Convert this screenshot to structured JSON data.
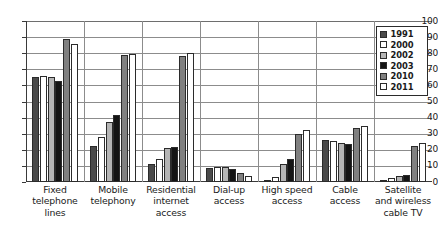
{
  "chart_data": {
    "type": "bar",
    "title": "",
    "xlabel": "",
    "ylabel": "",
    "ylim": [
      0,
      100
    ],
    "yticks": [
      0,
      10,
      20,
      30,
      40,
      50,
      60,
      70,
      80,
      90,
      100
    ],
    "ytick_labels": [
      "0",
      "10",
      "20",
      "30",
      "40",
      "50",
      "60",
      "70",
      "80",
      "90",
      "100"
    ],
    "grid": true,
    "legend_position": "top-right",
    "categories": [
      "Fixed telephone lines",
      "Mobile telephony",
      "Residential internet access",
      "Dial-up access",
      "High speed access",
      "Cable access",
      "Satellite and wireless cable TV"
    ],
    "category_lines": [
      [
        "Fixed",
        "telephone",
        "lines"
      ],
      [
        "Mobile",
        "telephony"
      ],
      [
        "Residential",
        "internet",
        "access"
      ],
      [
        "Dial-up",
        "access"
      ],
      [
        "High speed",
        "access"
      ],
      [
        "Cable",
        "access"
      ],
      [
        "Satellite",
        "and wireless",
        "cable TV"
      ]
    ],
    "series": [
      {
        "name": "1991",
        "color": "#4a4a4a",
        "values": [
          65,
          22.5,
          11,
          9,
          1.5,
          26,
          1
        ]
      },
      {
        "name": "2000",
        "color": "#ffffff",
        "values": [
          66,
          28,
          14,
          9.5,
          3,
          25.5,
          2.5
        ]
      },
      {
        "name": "2002",
        "color": "#b5b5b5",
        "values": [
          65,
          37.5,
          21,
          9.5,
          11,
          24,
          3.5
        ]
      },
      {
        "name": "2003",
        "color": "#141414",
        "values": [
          63,
          41.5,
          22,
          8,
          14,
          23.5,
          4.5
        ]
      },
      {
        "name": "2010",
        "color": "#808080",
        "values": [
          89,
          79,
          78,
          5.5,
          30,
          33.5,
          22.5
        ]
      },
      {
        "name": "2011",
        "color": "#ffffff",
        "values": [
          86,
          79.5,
          80,
          4,
          32,
          34.5,
          24.5
        ]
      }
    ],
    "legend_entries": [
      {
        "label": "1991",
        "color": "#4a4a4a"
      },
      {
        "label": "2000",
        "color": "#ffffff"
      },
      {
        "label": "2002",
        "color": "#b5b5b5"
      },
      {
        "label": "2003",
        "color": "#141414"
      },
      {
        "label": "2010",
        "color": "#808080"
      },
      {
        "label": "2011",
        "color": "#ffffff"
      }
    ],
    "colors": {
      "axis": "#3a3a3a",
      "gridline": "#8c8c8c",
      "bar_outline": "#2b2b2b",
      "background": "#ffffff",
      "text": "#1a1a1a"
    }
  }
}
